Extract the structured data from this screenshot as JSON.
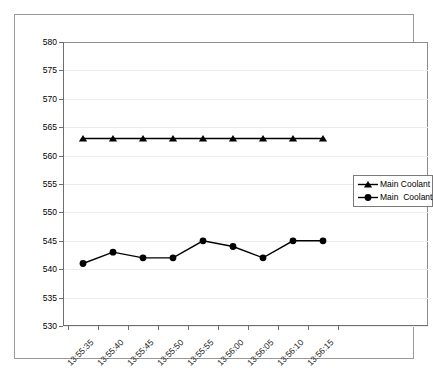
{
  "chart_data": {
    "type": "line",
    "title": "",
    "subtitle": "",
    "xlabel": "",
    "ylabel": "",
    "ylim": [
      530,
      580
    ],
    "ytick_step": 5,
    "yticks": [
      580,
      575,
      570,
      565,
      560,
      555,
      550,
      545,
      540,
      535,
      530
    ],
    "grid": true,
    "grid_axis": "y",
    "legend_position": "right",
    "categories": [
      "13:55:35",
      "13:55:40",
      "13:55:45",
      "13:55:50",
      "13:55:55",
      "13:56:00",
      "13:56:05",
      "13:56:10",
      "13:56:15"
    ],
    "series": [
      {
        "name": "Main Coolant",
        "marker": "triangle",
        "color": "#000000",
        "values": [
          563,
          563,
          563,
          563,
          563,
          563,
          563,
          563,
          563
        ]
      },
      {
        "name": "Main  Coolant",
        "marker": "circle",
        "color": "#000000",
        "values": [
          541,
          543,
          542,
          542,
          545,
          544,
          542,
          545,
          545
        ]
      }
    ]
  },
  "legend": {
    "entries": [
      {
        "label": "Main Coolant",
        "marker": "triangle-marker-icon"
      },
      {
        "label": "Main  Coolant",
        "marker": "circle-marker-icon"
      }
    ]
  },
  "colors": {
    "series_line": "#000000",
    "gridline": "#ececec",
    "axis": "#6e6e6e",
    "frame": "#9a9a9a",
    "background": "#ffffff"
  }
}
